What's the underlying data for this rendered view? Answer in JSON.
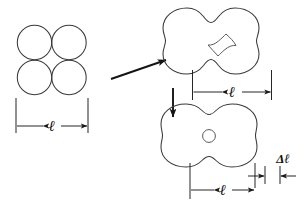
{
  "figure": {
    "title": "",
    "background_color": "#ffffff",
    "stroke_color": "#3a3a3a",
    "arrow_color": "#141414",
    "dimension_color": "#1a1a1a"
  },
  "panels": {
    "left": {
      "name": "four-tangent-circles",
      "description": "2x2 array of four tangent circles",
      "circle_count": 4,
      "dimension_label": "ℓ"
    },
    "top_right": {
      "name": "quatrefoil-with-diamond-hole",
      "description": "four-lobed clover shape with concave diamond hole at center",
      "dimension_label": "ℓ"
    },
    "bottom_right": {
      "name": "rounded-quatrefoil-with-round-hole",
      "description": "rounded scalloped square with small circular hole at center",
      "dimension_label": "ℓ",
      "delta_label": "Δℓ"
    }
  },
  "arrows": {
    "diagonal": {
      "name": "arrow-to-top-right",
      "direction": "up-right"
    },
    "vertical": {
      "name": "arrow-to-bottom-right",
      "direction": "down"
    }
  }
}
